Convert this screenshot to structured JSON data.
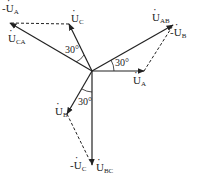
{
  "diagram": {
    "type": "phasor-diagram",
    "origin": [
      92,
      71
    ],
    "phasors": [
      {
        "id": "UA",
        "label": "U",
        "sub": "A",
        "tip": [
          144,
          71
        ],
        "style": "solid"
      },
      {
        "id": "UB",
        "label": "U",
        "sub": "B",
        "tip": [
          67,
          114
        ],
        "style": "solid"
      },
      {
        "id": "UC",
        "label": "U",
        "sub": "C",
        "tip": [
          69,
          24
        ],
        "style": "solid"
      },
      {
        "id": "UAB",
        "label": "U",
        "sub": "AB",
        "tip": [
          173,
          25
        ],
        "style": "solid"
      },
      {
        "id": "UBC",
        "label": "U",
        "sub": "BC",
        "tip": [
          92,
          165
        ],
        "style": "solid"
      },
      {
        "id": "UCA",
        "label": "U",
        "sub": "CA",
        "tip": [
          10,
          23
        ],
        "style": "solid"
      }
    ],
    "dashed": [
      {
        "id": "negUA",
        "label": "-U",
        "sub": "A",
        "from": [
          69,
          24
        ],
        "to": [
          10,
          23
        ]
      },
      {
        "id": "negUB",
        "label": "-U",
        "sub": "B",
        "from": [
          144,
          71
        ],
        "to": [
          173,
          25
        ]
      },
      {
        "id": "negUC",
        "label": "-U",
        "sub": "C",
        "from": [
          67,
          114
        ],
        "to": [
          92,
          165
        ]
      }
    ],
    "angles": [
      "30°",
      "30°",
      "30°"
    ],
    "labels": {
      "negUA": {
        "prefix": "-",
        "main": "U",
        "sub": "A"
      },
      "UC": {
        "main": "U",
        "sub": "C"
      },
      "UCA": {
        "main": "U",
        "sub": "CA"
      },
      "UAB": {
        "main": "U",
        "sub": "AB"
      },
      "negUB": {
        "prefix": "-",
        "main": "U",
        "sub": "B"
      },
      "UA": {
        "main": "U",
        "sub": "A"
      },
      "UB": {
        "main": "U",
        "sub": "B"
      },
      "negUC": {
        "prefix": "-",
        "main": "U",
        "sub": "C"
      },
      "UBC": {
        "main": "U",
        "sub": "BC"
      }
    }
  }
}
